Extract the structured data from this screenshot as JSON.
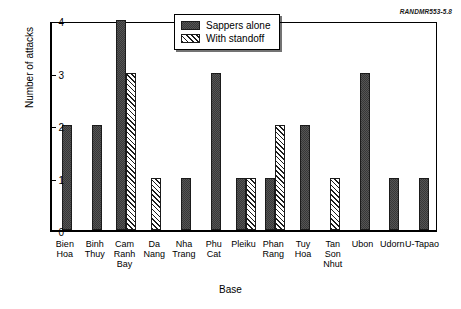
{
  "figure": {
    "id_label": "RANDMR553-5.8"
  },
  "legend": {
    "items": [
      {
        "label": "Sappers alone",
        "pattern": "solid",
        "color": "#555555"
      },
      {
        "label": "With standoff",
        "pattern": "hatch",
        "color": "#ffffff"
      }
    ]
  },
  "chart_data": {
    "type": "bar",
    "title": "",
    "xlabel": "Base",
    "ylabel": "Number of attacks",
    "ylim": [
      0,
      4
    ],
    "yticks": [
      0,
      1,
      2,
      3,
      4
    ],
    "grid": false,
    "legend_position": "upper center-right",
    "categories": [
      "Bien Hoa",
      "Binh Thuy",
      "Cam Ranh Bay",
      "Da Nang",
      "Nha Trang",
      "Phu Cat",
      "Pleiku",
      "Phan Rang",
      "Tuy Hoa",
      "Tan Son Nhut",
      "Ubon",
      "Udorn",
      "U-Tapao"
    ],
    "category_label_lines": [
      [
        "Bien",
        "Hoa"
      ],
      [
        "Binh",
        "Thuy"
      ],
      [
        "Cam",
        "Ranh",
        "Bay"
      ],
      [
        "Da",
        "Nang"
      ],
      [
        "Nha",
        "Trang"
      ],
      [
        "Phu",
        "Cat"
      ],
      [
        "Pleiku"
      ],
      [
        "Phan",
        "Rang"
      ],
      [
        "Tuy",
        "Hoa"
      ],
      [
        "Tan",
        "Son",
        "Nhut"
      ],
      [
        "Ubon"
      ],
      [
        "Udorn"
      ],
      [
        "U-Tapao"
      ]
    ],
    "series": [
      {
        "name": "Sappers alone",
        "pattern": "solid",
        "values": [
          2,
          2,
          4,
          0,
          1,
          3,
          1,
          1,
          2,
          0,
          3,
          1,
          1
        ]
      },
      {
        "name": "With standoff",
        "pattern": "hatch",
        "values": [
          0,
          0,
          3,
          1,
          0,
          0,
          1,
          2,
          0,
          1,
          0,
          0,
          0
        ]
      }
    ]
  }
}
